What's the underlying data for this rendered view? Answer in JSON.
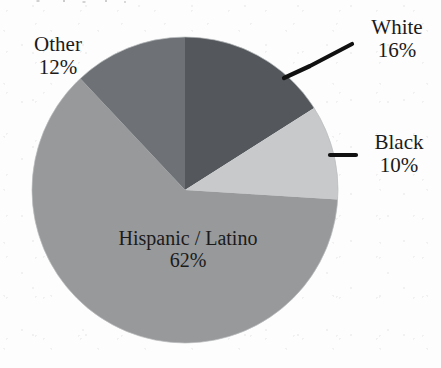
{
  "chart_data": {
    "type": "pie",
    "title": "",
    "categories": [
      "White",
      "Black",
      "Hispanic / Latino",
      "Other"
    ],
    "values": [
      16,
      10,
      62,
      12
    ],
    "value_unit": "%",
    "value_labels": [
      "16%",
      "10%",
      "62%",
      "12%"
    ],
    "legend": "none",
    "label_placement": "callout",
    "slices": [
      {
        "name": "White",
        "value": 16,
        "value_label": "16%",
        "color": "#54585c",
        "start_angle_deg": 0,
        "end_angle_deg": 57.6,
        "label_position": "outside-top-right",
        "has_leader_line": true
      },
      {
        "name": "Black",
        "value": 10,
        "value_label": "10%",
        "color": "#c8c9cb",
        "start_angle_deg": 57.6,
        "end_angle_deg": 93.6,
        "label_position": "outside-right",
        "has_leader_line": true
      },
      {
        "name": "Hispanic / Latino",
        "value": 62,
        "value_label": "62%",
        "color": "#97999b",
        "start_angle_deg": 93.6,
        "end_angle_deg": 316.8,
        "label_position": "inside",
        "has_leader_line": false
      },
      {
        "name": "Other",
        "value": 12,
        "value_label": "12%",
        "color": "#6e7276",
        "start_angle_deg": 316.8,
        "end_angle_deg": 360,
        "label_position": "outside-top-left",
        "has_leader_line": false
      }
    ],
    "geometry": {
      "center_x": 185,
      "center_y": 190,
      "radius": 153,
      "start_at_twelve_oclock": true,
      "direction": "clockwise"
    },
    "colors": {
      "white_slice": "#54585c",
      "black_slice": "#c8c9cb",
      "hispanic_latino_slice": "#97999b",
      "other_slice": "#6e7276",
      "leader_line": "#111111",
      "text": "#1b1b1b",
      "background": "#fdfdfd"
    }
  }
}
